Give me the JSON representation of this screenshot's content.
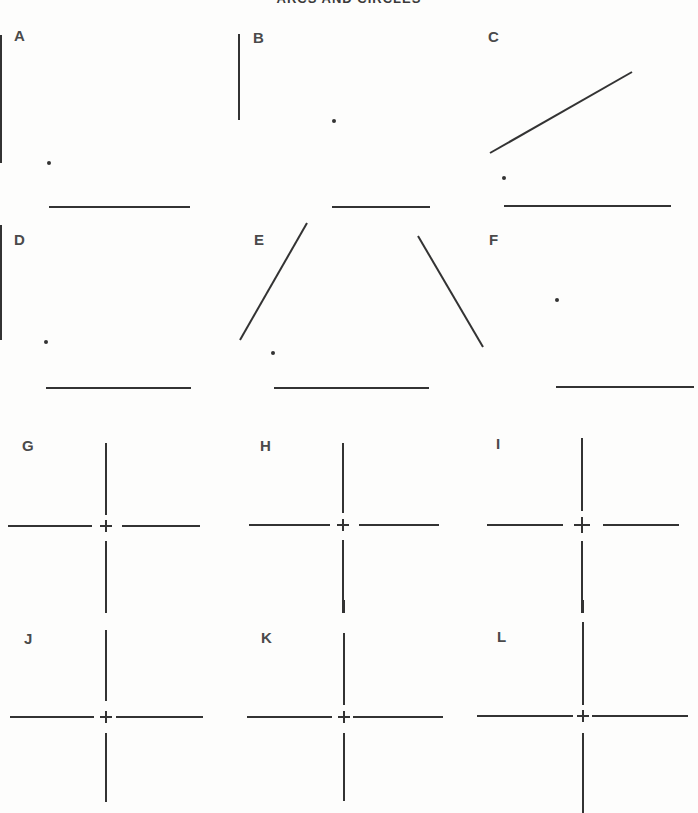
{
  "title": "ARCS AND CIRCLES",
  "colors": {
    "ink": "#333333",
    "label": "#4a4a4a",
    "paper": "#fdfdfc"
  },
  "panels": [
    {
      "id": "A",
      "label": "A",
      "type": "arc-construction",
      "label_pos": [
        14,
        28
      ],
      "lines": [
        [
          1,
          35,
          1,
          163
        ],
        [
          49,
          207,
          190,
          207
        ]
      ],
      "dots": [
        [
          49,
          163
        ]
      ]
    },
    {
      "id": "B",
      "label": "B",
      "type": "arc-construction",
      "label_pos": [
        253,
        30
      ],
      "lines": [
        [
          239,
          34,
          239,
          120
        ],
        [
          332,
          207,
          430,
          207
        ]
      ],
      "dots": [
        [
          334,
          121
        ]
      ]
    },
    {
      "id": "C",
      "label": "C",
      "type": "arc-construction",
      "label_pos": [
        488,
        29
      ],
      "lines": [
        [
          490,
          153,
          632,
          72
        ],
        [
          504,
          206,
          671,
          206
        ]
      ],
      "dots": [
        [
          504,
          178
        ]
      ]
    },
    {
      "id": "D",
      "label": "D",
      "type": "arc-construction",
      "label_pos": [
        14,
        232
      ],
      "lines": [
        [
          1,
          225,
          1,
          340
        ],
        [
          46,
          388,
          191,
          388
        ]
      ],
      "dots": [
        [
          46,
          342
        ]
      ]
    },
    {
      "id": "E",
      "label": "E",
      "type": "arc-construction",
      "label_pos": [
        254,
        232
      ],
      "lines": [
        [
          307,
          223,
          240,
          340
        ],
        [
          274,
          388,
          429,
          388
        ]
      ],
      "dots": [
        [
          273,
          353
        ]
      ]
    },
    {
      "id": "F",
      "label": "F",
      "type": "arc-construction",
      "label_pos": [
        489,
        232
      ],
      "lines": [
        [
          418,
          236,
          483,
          347
        ],
        [
          556,
          387,
          694,
          387
        ]
      ],
      "dots": [
        [
          557,
          300
        ]
      ]
    },
    {
      "id": "G",
      "label": "G",
      "type": "circle-centerlines",
      "label_pos": [
        22,
        438
      ],
      "center": [
        106,
        526
      ],
      "lines": [
        [
          106,
          443,
          106,
          515
        ],
        [
          106,
          541,
          106,
          613
        ],
        [
          8,
          526,
          92,
          526
        ],
        [
          122,
          526,
          200,
          526
        ]
      ],
      "cross_size": 6
    },
    {
      "id": "H",
      "label": "H",
      "type": "circle-centerlines",
      "label_pos": [
        260,
        438
      ],
      "center": [
        343,
        525
      ],
      "lines": [
        [
          343,
          443,
          343,
          513
        ],
        [
          343,
          540,
          343,
          613
        ],
        [
          249,
          525,
          330,
          525
        ],
        [
          359,
          525,
          439,
          525
        ]
      ],
      "cross_size": 6
    },
    {
      "id": "I",
      "label": "I",
      "type": "circle-centerlines",
      "label_pos": [
        496,
        436
      ],
      "center": [
        582,
        525
      ],
      "lines": [
        [
          582,
          438,
          582,
          511
        ],
        [
          582,
          541,
          582,
          613
        ],
        [
          487,
          525,
          563,
          525
        ],
        [
          603,
          525,
          679,
          525
        ]
      ],
      "cross_size": 8
    },
    {
      "id": "J",
      "label": "J",
      "type": "circle-centerlines",
      "label_pos": [
        24,
        631
      ],
      "center": [
        106,
        717
      ],
      "lines": [
        [
          106,
          600,
          106,
          613
        ],
        [
          106,
          630,
          106,
          701
        ],
        [
          106,
          733,
          106,
          802
        ],
        [
          10,
          717,
          94,
          717
        ],
        [
          116,
          717,
          203,
          717
        ]
      ],
      "cross_size": 6
    },
    {
      "id": "K",
      "label": "K",
      "type": "circle-centerlines",
      "label_pos": [
        261,
        630
      ],
      "center": [
        344,
        717
      ],
      "lines": [
        [
          344,
          600,
          344,
          613
        ],
        [
          344,
          633,
          344,
          705
        ],
        [
          344,
          733,
          344,
          801
        ],
        [
          247,
          717,
          332,
          717
        ],
        [
          353,
          717,
          443,
          717
        ]
      ],
      "cross_size": 6
    },
    {
      "id": "L",
      "label": "L",
      "type": "circle-centerlines",
      "label_pos": [
        497,
        629
      ],
      "center": [
        583,
        716
      ],
      "lines": [
        [
          583,
          600,
          583,
          613
        ],
        [
          583,
          622,
          583,
          705
        ],
        [
          583,
          733,
          583,
          813
        ],
        [
          477,
          716,
          573,
          716
        ],
        [
          592,
          716,
          688,
          716
        ]
      ],
      "cross_size": 6
    }
  ]
}
